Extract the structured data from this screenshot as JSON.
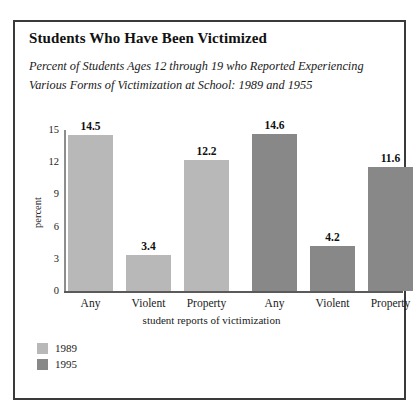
{
  "figure": {
    "title": "Students Who Have Been Victimized",
    "subtitle_line1": "Percent of Students Ages 12 through 19 who Reported Experiencing",
    "subtitle_line2": "Various  Forms of Victimization at School: 1989 and 1955"
  },
  "chart_data": {
    "type": "bar",
    "title": "Students Who Have Been Victimized",
    "subtitle": "Percent of Students Ages 12 through 19 who Reported Experiencing Various  Forms of Victimization at School: 1989 and 1955",
    "categories": [
      "Any",
      "Violent",
      "Property"
    ],
    "series": [
      {
        "name": "1989",
        "color": "#b8b8b8",
        "values": [
          14.5,
          3.4,
          12.2
        ]
      },
      {
        "name": "1995",
        "color": "#888888",
        "values": [
          14.6,
          4.2,
          11.6
        ]
      }
    ],
    "bars": [
      {
        "category": "Any",
        "series": "1989",
        "value": 14.5,
        "label": "14.5",
        "color": "#b8b8b8"
      },
      {
        "category": "Violent",
        "series": "1989",
        "value": 3.4,
        "label": "3.4",
        "color": "#b8b8b8"
      },
      {
        "category": "Property",
        "series": "1989",
        "value": 12.2,
        "label": "12.2",
        "color": "#b8b8b8"
      },
      {
        "category": "Any",
        "series": "1995",
        "value": 14.6,
        "label": "14.6",
        "color": "#888888"
      },
      {
        "category": "Violent",
        "series": "1995",
        "value": 4.2,
        "label": "4.2",
        "color": "#888888"
      },
      {
        "category": "Property",
        "series": "1995",
        "value": 11.6,
        "label": "11.6",
        "color": "#888888"
      }
    ],
    "xlabel": "student reports of victimization",
    "ylabel": "percent",
    "ylim": [
      0,
      15
    ],
    "yticks": [
      0,
      3,
      6,
      9,
      12,
      15
    ],
    "ytick_labels": [
      "0",
      "3",
      "6",
      "9",
      "12",
      "15"
    ],
    "grid": false,
    "legend_position": "bottom-left",
    "legend": [
      {
        "label": "1989",
        "color": "#b8b8b8"
      },
      {
        "label": "1995",
        "color": "#888888"
      }
    ]
  }
}
